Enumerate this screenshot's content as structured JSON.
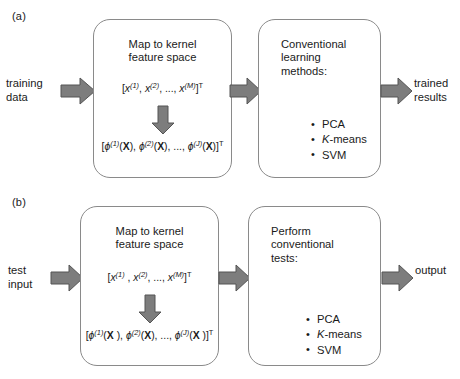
{
  "figure": {
    "type": "flow-diagram",
    "panels": [
      {
        "label": "(a)",
        "input_label": "training\ndata",
        "output_label": "trained\nresults",
        "box1": {
          "title": "Map to kernel\nfeature space",
          "formula_top": {
            "open": "[",
            "terms": [
              "x",
              "x",
              "x"
            ],
            "sups": [
              "(1)",
              "(2)",
              "(M)"
            ],
            "ellipsis": "...,",
            "close": "]",
            "transpose": "T",
            "plain": "[x(1), x(2), ..., x(M)]T"
          },
          "formula_bottom": {
            "open": "[",
            "symbol": "ϕ",
            "argument": "X",
            "sups": [
              "(1)",
              "(2)",
              "(J)"
            ],
            "ellipsis": "...,",
            "close": "]",
            "transpose": "T",
            "plain": "[ϕ(1)(X), ϕ(2)(X), ..., ϕ(J)(X)]T"
          }
        },
        "box2": {
          "title": "Conventional\nlearning\nmethods:",
          "bullets": [
            "PCA",
            "K-means",
            "SVM"
          ],
          "bullet_italic_prefix": [
            "",
            "K",
            ""
          ]
        }
      },
      {
        "label": "(b)",
        "input_label": "test\ninput",
        "output_label": "output",
        "box1": {
          "title": "Map to kernel\nfeature space",
          "formula_top": {
            "open": "[",
            "terms": [
              "x",
              "x",
              "x"
            ],
            "sups": [
              "(1)",
              "(2)",
              "(M)"
            ],
            "ellipsis": "...,",
            "close": "]",
            "transpose": "T",
            "plain": "[x(1) , x(2), ..., x(M)]T"
          },
          "formula_bottom": {
            "open": "[",
            "symbol": "ϕ",
            "argument": "X",
            "sups": [
              "(1)",
              "(2)",
              "(J)"
            ],
            "ellipsis": "...,",
            "close": "]",
            "transpose": "T",
            "plain": "[ϕ(1)(X ), ϕ(2)(X), ..., ϕ(J)(X )]T"
          }
        },
        "box2": {
          "title": "Perform\nconventional\ntests:",
          "bullets": [
            "PCA",
            "K-means",
            "SVM"
          ],
          "bullet_italic_prefix": [
            "",
            "K",
            ""
          ]
        }
      }
    ],
    "colors": {
      "arrow_fill": "#7d7d7d",
      "arrow_stroke": "#555555",
      "box_border": "#8a8a8a",
      "text": "#1a1a1a",
      "background": "#ffffff"
    }
  }
}
